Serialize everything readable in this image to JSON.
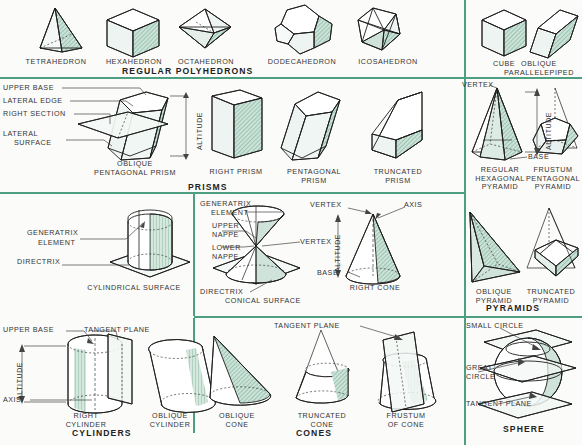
{
  "plate": {
    "title": "Geometric Solids Reference Plate",
    "accent_color": "#4e9e83",
    "shade_color": "#cfe3da",
    "line_color": "#1d1d1d",
    "background": "#fbfbf9"
  },
  "sections": [
    {
      "id": "regular-polyhedrons",
      "group_label": "REGULAR POLYHEDRONS",
      "items": [
        {
          "label": "TETRAHEDRON"
        },
        {
          "label": "HEXAHEDRON"
        },
        {
          "label": "OCTAHEDRON"
        },
        {
          "label": "DODECAHEDRON"
        },
        {
          "label": "ICOSAHEDRON"
        }
      ]
    },
    {
      "id": "parallelepipeds",
      "group_label": "",
      "items": [
        {
          "label": "CUBE"
        },
        {
          "label_line1": "OBLIQUE",
          "label_line2": "PARALLELEPIPED"
        }
      ]
    },
    {
      "id": "prisms",
      "group_label": "PRISMS",
      "callouts": [
        "UPPER BASE",
        "LATERAL EDGE",
        "RIGHT SECTION",
        "LATERAL",
        "SURFACE",
        "ALTITUDE"
      ],
      "items": [
        {
          "label_line1": "OBLIQUE",
          "label_line2": "PENTAGONAL PRISM"
        },
        {
          "label_line1": "RIGHT PRISM",
          "label_line2": ""
        },
        {
          "label_line1": "PENTAGONAL",
          "label_line2": "PRISM"
        },
        {
          "label_line1": "TRUNCATED",
          "label_line2": "PRISM"
        }
      ]
    },
    {
      "id": "pyramids",
      "group_label": "PYRAMIDS",
      "callouts": [
        "VERTEX",
        "ALTITUDE",
        "BASE"
      ],
      "items": [
        {
          "label_line1": "REGULAR",
          "label_line2": "HEXAGONAL",
          "label_line3": "PYRAMID"
        },
        {
          "label_line1": "FRUSTUM",
          "label_line2": "PENTAGONAL",
          "label_line3": "PYRAMID"
        },
        {
          "label_line1": "OBLIQUE",
          "label_line2": "PYRAMID"
        },
        {
          "label_line1": "TRUNCATED",
          "label_line2": "PYRAMID"
        }
      ]
    },
    {
      "id": "cylindrical-surface",
      "group_label": "CYLINDRICAL SURFACE",
      "callouts": [
        "GENERATRIX",
        "ELEMENT",
        "DIRECTRIX"
      ]
    },
    {
      "id": "conical-surface",
      "group_label": "CONICAL SURFACE",
      "callouts": [
        "GENERATRIX",
        "ELEMENT",
        "UPPER",
        "NAPPE",
        "LOWER",
        "NAPPE",
        "VERTEX",
        "DIRECTRIX"
      ]
    },
    {
      "id": "right-cone-detail",
      "group_label": "RIGHT CONE",
      "callouts": [
        "VERTEX",
        "AXIS",
        "ALTITUDE",
        "BASE"
      ]
    },
    {
      "id": "cylinders",
      "group_label": "CYLINDERS",
      "callouts": [
        "UPPER BASE",
        "TANGENT PLANE",
        "ALTITUDE",
        "AXIS"
      ],
      "items": [
        {
          "label_line1": "RIGHT",
          "label_line2": "CYLINDER"
        },
        {
          "label_line1": "OBLIQUE",
          "label_line2": "CYLINDER"
        }
      ]
    },
    {
      "id": "cones",
      "group_label": "CONES",
      "callouts": [
        "TANGENT PLANE"
      ],
      "items": [
        {
          "label_line1": "OBLIQUE",
          "label_line2": "CONE"
        },
        {
          "label_line1": "TRUNCATED",
          "label_line2": "CONE"
        },
        {
          "label_line1": "FRUSTUM",
          "label_line2": "OF CONE"
        }
      ]
    },
    {
      "id": "sphere",
      "group_label": "SPHERE",
      "callouts": [
        "SMALL CIRCLE",
        "GREAT",
        "CIRCLE",
        "TANGENT PLANE"
      ]
    }
  ]
}
